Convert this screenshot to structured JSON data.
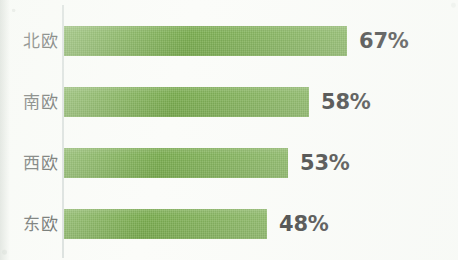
{
  "chart_data": {
    "type": "bar",
    "orientation": "horizontal",
    "title": "",
    "subtitle": "",
    "xlabel": "",
    "ylabel": "",
    "categories": [
      "北欧",
      "南欧",
      "西欧",
      "东欧"
    ],
    "values": [
      67,
      58,
      53,
      48
    ],
    "value_labels": [
      "67%",
      "58%",
      "53%",
      "48%"
    ],
    "unit": "%",
    "xlim": [
      0,
      78
    ],
    "grid": false,
    "legend": false,
    "legend_position": "none",
    "series": [
      {
        "name": "",
        "values": [
          67,
          58,
          53,
          48
        ],
        "color": "#7db052"
      }
    ],
    "points": [
      {
        "category": "北欧",
        "value": 67,
        "label": "67%"
      },
      {
        "category": "南欧",
        "value": 58,
        "label": "58%"
      },
      {
        "category": "西欧",
        "value": 53,
        "label": "53%"
      },
      {
        "category": "东欧",
        "value": 48,
        "label": "48%"
      }
    ]
  },
  "colors": {
    "bar": "#7db052",
    "axis_line": "#d7dddb",
    "category_text": "#4f5350",
    "value_text": "#2c2c2c",
    "background": "#fbfcf9"
  }
}
